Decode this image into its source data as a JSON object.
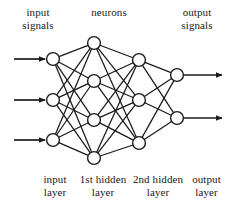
{
  "diagram": {
    "type": "feedforward-neural-network",
    "colors": {
      "stroke": "#1a1a1a",
      "node_fill": "#ffffff",
      "background": "#ffffff"
    },
    "labels": {
      "top_left": "input\nsignals",
      "top_middle": "neurons",
      "top_right": "output\nsignals",
      "bottom_input": "input\nlayer",
      "bottom_hidden1": "1st hidden\nlayer",
      "bottom_hidden2": "2nd hidden\nlayer",
      "bottom_output": "output\nlayer"
    },
    "geometry": {
      "width": 231,
      "height": 208,
      "node_radius": 6.4,
      "input_arrow_start_x": 14,
      "output_arrow_end_x": 222
    },
    "layers": [
      {
        "id": "input",
        "name": "input layer",
        "node_count": 3,
        "x": 53,
        "node_y": [
          59,
          100,
          140
        ]
      },
      {
        "id": "hidden1",
        "name": "1st hidden layer",
        "node_count": 4,
        "x": 94,
        "node_y": [
          43,
          81,
          120,
          158
        ]
      },
      {
        "id": "hidden2",
        "name": "2nd hidden layer",
        "node_count": 3,
        "x": 139,
        "node_y": [
          60,
          100,
          143
        ]
      },
      {
        "id": "output",
        "name": "output layer",
        "node_count": 2,
        "x": 177,
        "node_y": [
          75,
          118
        ]
      }
    ],
    "connections": [
      {
        "from": "input",
        "to": "hidden1",
        "pattern": "fully-connected",
        "count": 12
      },
      {
        "from": "hidden1",
        "to": "hidden2",
        "pattern": "fully-connected",
        "count": 12
      },
      {
        "from": "hidden2",
        "to": "output",
        "pattern": "fully-connected",
        "count": 6
      }
    ],
    "signal_arrows": {
      "input_count": 3,
      "output_count": 2
    }
  }
}
